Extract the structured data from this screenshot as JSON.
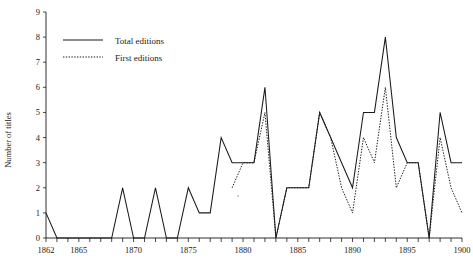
{
  "chart_data": {
    "type": "line",
    "title": "",
    "xlabel": "",
    "ylabel": "Number of titles",
    "xlim": [
      1862,
      1900
    ],
    "ylim": [
      0,
      9
    ],
    "grid": false,
    "legend_position": "top-left",
    "x_tick_step": 1,
    "x_label_step": 5,
    "y_tick_step": 1,
    "x_tick_labels": [
      "1862",
      "1865",
      "1870",
      "1875",
      "1880",
      "1885",
      "1890",
      "1895",
      "1900"
    ],
    "x_tick_label_values": [
      1862,
      1865,
      1870,
      1875,
      1880,
      1885,
      1890,
      1895,
      1900
    ],
    "y_tick_labels": [
      "0",
      "1",
      "2",
      "3",
      "4",
      "5",
      "6",
      "7",
      "8",
      "9"
    ],
    "y_tick_label_values": [
      0,
      1,
      2,
      3,
      4,
      5,
      6,
      7,
      8,
      9
    ],
    "x": [
      1862,
      1863,
      1864,
      1865,
      1866,
      1867,
      1868,
      1869,
      1870,
      1871,
      1872,
      1873,
      1874,
      1875,
      1876,
      1877,
      1878,
      1879,
      1880,
      1881,
      1882,
      1883,
      1884,
      1885,
      1886,
      1887,
      1888,
      1889,
      1890,
      1891,
      1892,
      1893,
      1894,
      1895,
      1896,
      1897,
      1898,
      1899,
      1900
    ],
    "series": [
      {
        "name": "Total editions",
        "style": "solid",
        "values": [
          1,
          0,
          0,
          0,
          0,
          0,
          0,
          2,
          0,
          0,
          2,
          0,
          0,
          2,
          1,
          1,
          4,
          3,
          3,
          3,
          6,
          0,
          2,
          2,
          2,
          5,
          4,
          3,
          2,
          5,
          5,
          8,
          4,
          3,
          3,
          0,
          5,
          3,
          3
        ]
      },
      {
        "name": "First editions",
        "style": "dotted",
        "values": [
          null,
          null,
          null,
          null,
          null,
          null,
          null,
          null,
          null,
          null,
          null,
          null,
          null,
          null,
          null,
          null,
          null,
          2,
          3,
          3,
          5,
          0,
          2,
          2,
          2,
          5,
          4,
          2,
          1,
          4,
          3,
          6,
          2,
          3,
          3,
          0,
          4,
          2,
          1
        ]
      }
    ]
  },
  "legend": {
    "items": [
      {
        "label": "Total editions",
        "style": "solid"
      },
      {
        "label": "First editions",
        "style": "dotted"
      }
    ]
  },
  "axes": {
    "y_title": "Number of titles"
  }
}
